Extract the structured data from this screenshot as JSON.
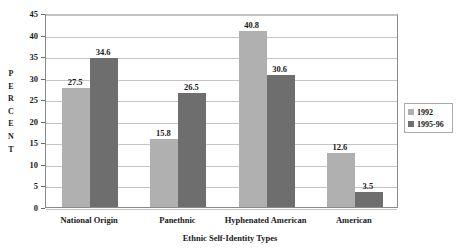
{
  "chart_data": {
    "type": "bar",
    "title": "",
    "xlabel": "Ethnic Self-Identity Types",
    "ylabel": "PERCENT",
    "ylim": [
      0,
      45
    ],
    "ytick_step": 5,
    "yticks": [
      0,
      5,
      10,
      15,
      20,
      25,
      30,
      35,
      40,
      45
    ],
    "grid": true,
    "legend_position": "right",
    "categories": [
      "National Origin",
      "Panethnic",
      "Hyphenated American",
      "American"
    ],
    "series": [
      {
        "name": "1992",
        "color": "#b0b0b0",
        "values": [
          27.5,
          15.8,
          40.8,
          12.6
        ]
      },
      {
        "name": "1995-96",
        "color": "#6e6e6e",
        "values": [
          34.6,
          26.5,
          30.6,
          3.5
        ]
      }
    ]
  },
  "legend": {
    "entries": [
      {
        "label": "1992"
      },
      {
        "label": "1995-96"
      }
    ]
  },
  "axis": {
    "y_title_letters": [
      "P",
      "E",
      "R",
      "C",
      "E",
      "N",
      "T"
    ]
  }
}
